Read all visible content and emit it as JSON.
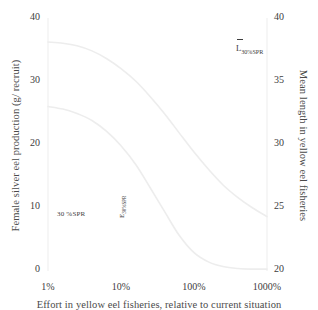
{
  "chart_data": {
    "type": "line",
    "title": "",
    "xlabel": "Effort in yellow eel fisheries, relative to current situation",
    "xscale": "log",
    "xlim": [
      1,
      1000
    ],
    "xunit": "%",
    "xticks": [
      1,
      10,
      100,
      1000
    ],
    "xticklabels": [
      "1%",
      "10%",
      "100%",
      "1000%"
    ],
    "grid": false,
    "legend": "none",
    "axes": [
      {
        "id": "left",
        "ylabel": "Female silver eel production (g/ recruit)",
        "ylim": [
          0,
          40
        ],
        "yticks": [
          0,
          10,
          20,
          30,
          40
        ],
        "yticklabels": [
          "0",
          "10",
          "20",
          "30",
          "40"
        ]
      },
      {
        "id": "right",
        "ylabel": "Mean length in yellow eel fisheries",
        "ylim": [
          20,
          40
        ],
        "yticks": [
          20,
          25,
          30,
          35,
          40
        ],
        "yticklabels": [
          "20",
          "25",
          "30",
          "35",
          "40"
        ]
      }
    ],
    "series": [
      {
        "name": "Mean length in yellow eel fisheries",
        "axis": "right",
        "color": "#ededed",
        "x": [
          1,
          1.6,
          2.5,
          4,
          6.3,
          10,
          16,
          25,
          40,
          63,
          100,
          160,
          250,
          400,
          630,
          1000
        ],
        "values": [
          38.1,
          38.0,
          37.8,
          37.4,
          36.8,
          36.0,
          35.0,
          33.8,
          32.4,
          30.9,
          29.4,
          28.0,
          26.8,
          25.8,
          25.0,
          24.3
        ]
      },
      {
        "name": "Female silver eel production (g/ recruit)",
        "axis": "left",
        "color": "#ededed",
        "x": [
          1,
          1.6,
          2.5,
          4,
          6.3,
          10,
          16,
          25,
          40,
          63,
          100,
          160,
          250,
          400,
          630,
          1000
        ],
        "values": [
          26.0,
          25.6,
          24.9,
          23.8,
          22.1,
          19.8,
          16.8,
          13.2,
          9.3,
          5.6,
          2.9,
          1.4,
          0.7,
          0.4,
          0.3,
          0.3
        ]
      }
    ],
    "annotations": [
      {
        "id": "spr-label",
        "text": "30 %SPR",
        "x": 2.0,
        "y": 8.5,
        "axis": "left",
        "rotation": 0
      },
      {
        "id": "e-threshold",
        "text": "E30%SPR",
        "x": 14,
        "y": 6.5,
        "axis": "left",
        "rotation": -90
      },
      {
        "id": "l-threshold",
        "text": "L30%SPR",
        "x": 330,
        "y": 36.5,
        "axis": "right",
        "rotation": 0,
        "overbar": true
      }
    ]
  },
  "labels": {
    "y_left": "Female silver eel production (g/ recruit)",
    "y_right": "Mean length in yellow eel fisheries",
    "x_axis": "Effort in yellow eel fisheries, relative to current situation",
    "anno_spr": "30 %SPR",
    "anno_e_main": "E",
    "anno_e_sub": "30%SPR",
    "anno_l_main": "L",
    "anno_l_sub": "30%SPR"
  },
  "ticks": {
    "left": [
      "40",
      "30",
      "20",
      "10",
      "0"
    ],
    "right": [
      "40",
      "35",
      "30",
      "25",
      "20"
    ],
    "x": [
      "1%",
      "10%",
      "100%",
      "1000%"
    ]
  },
  "colors": {
    "curve": "#ededed",
    "axis": "#f2f2f2",
    "text": "#3d3d3d"
  }
}
